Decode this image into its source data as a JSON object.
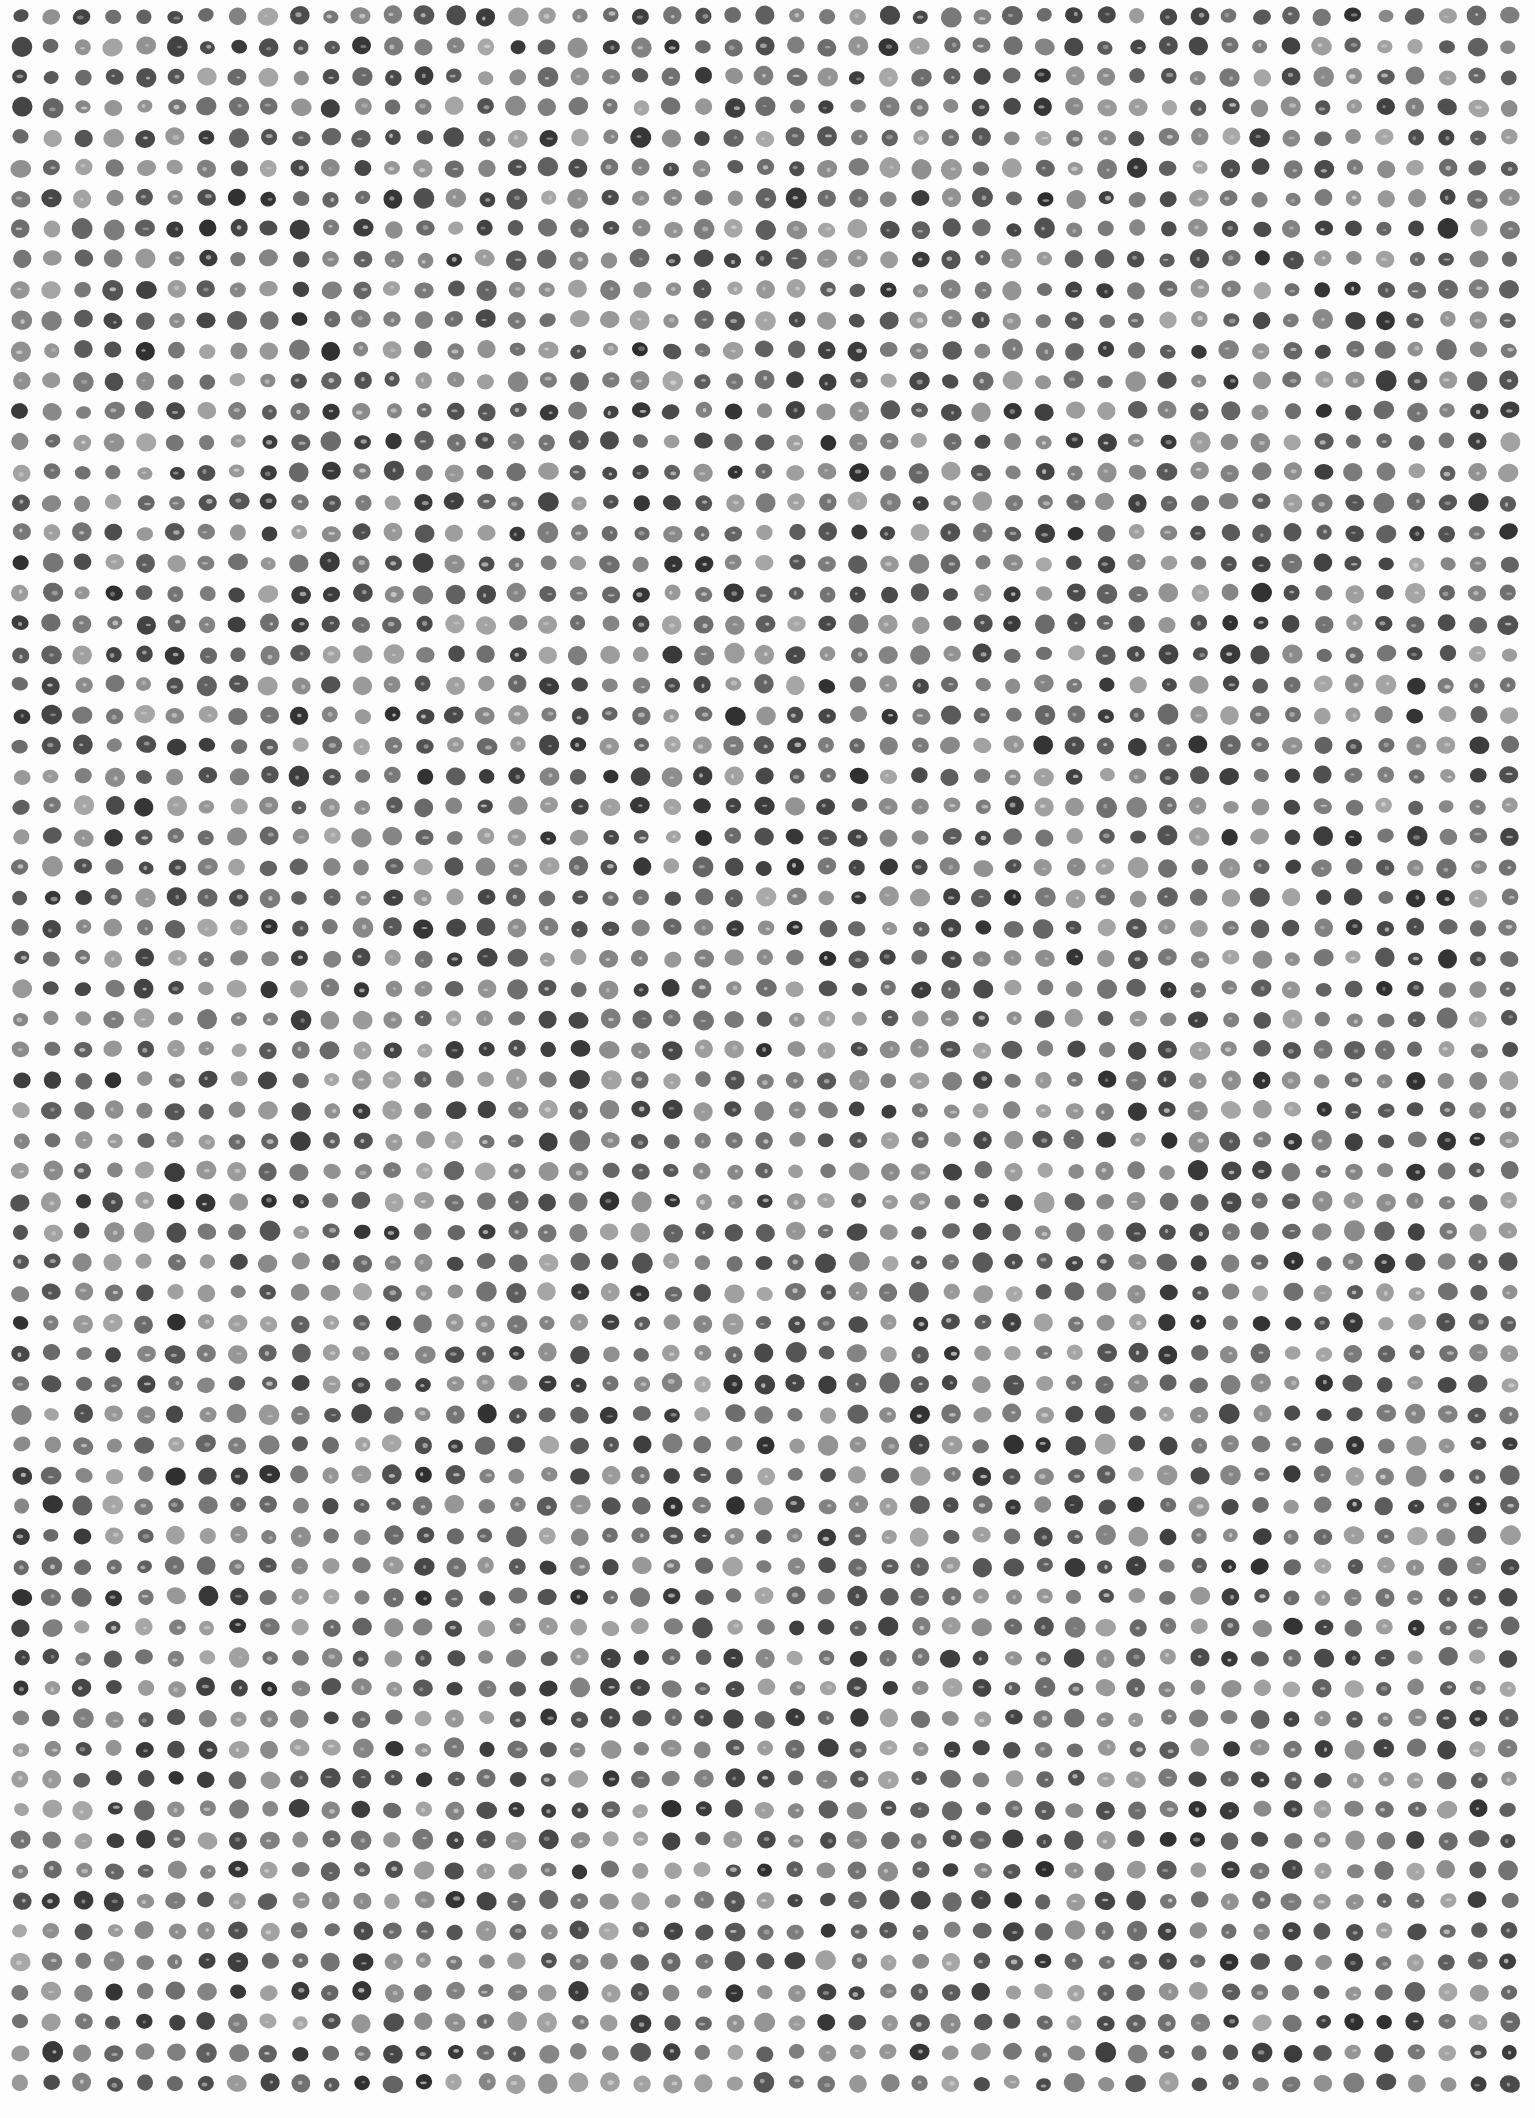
{
  "artwork": {
    "description": "Hand-drawn graphite dot grid on white paper",
    "background": "#fdfdfd",
    "grid": {
      "columns": 49,
      "rows": 69,
      "origin_x": 21,
      "origin_y": 16,
      "spacing_x": 31.0,
      "spacing_y": 30.4
    },
    "dot": {
      "radius_min": 7.5,
      "radius_max": 10.5,
      "shade_darkest": "#2e2e2e",
      "shade_lightest": "#a8a8a8",
      "highlight_color": "#d8d8d8"
    },
    "seed": 20240517
  }
}
